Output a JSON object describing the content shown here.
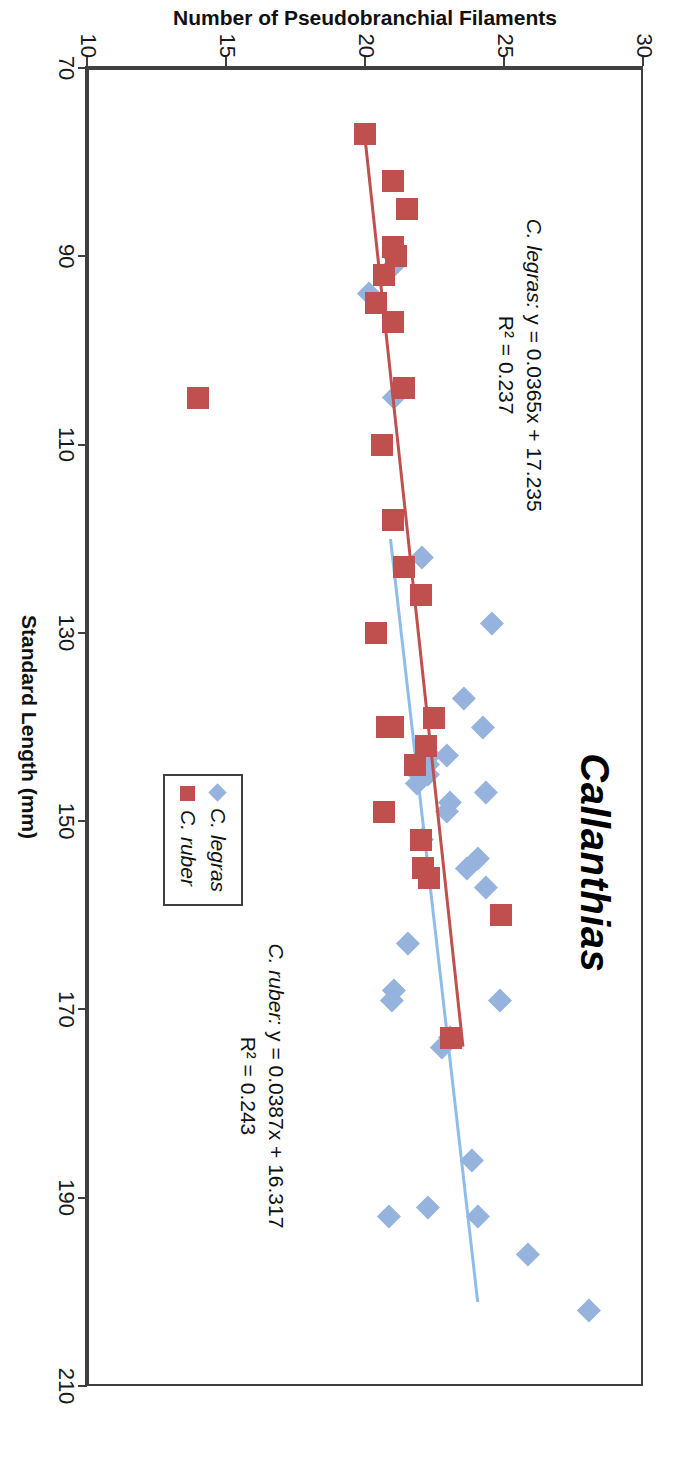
{
  "chart_data": {
    "type": "scatter",
    "title": "Callanthias",
    "xlabel": "Standard Length (mm)",
    "ylabel": "Number of Pseudobranchial Filaments",
    "xlim": [
      70,
      210
    ],
    "ylim": [
      10,
      30
    ],
    "xticks": [
      70,
      90,
      110,
      130,
      150,
      170,
      190,
      210
    ],
    "yticks": [
      10,
      15,
      20,
      25,
      30
    ],
    "grid": false,
    "legend_position": "bottom-right-inside",
    "colors": {
      "legras": "#95B3DD",
      "ruber": "#C0504D",
      "axis": "#3F3F3F"
    },
    "series": [
      {
        "name": "C. legras",
        "marker": "diamond",
        "color": "#95B3DD",
        "points": [
          [
            94,
            20.1
          ],
          [
            91,
            21.0
          ],
          [
            90,
            21.0
          ],
          [
            105,
            21.0
          ],
          [
            122,
            22.0
          ],
          [
            129,
            24.5
          ],
          [
            137,
            23.5
          ],
          [
            140,
            24.2
          ],
          [
            143,
            22.9
          ],
          [
            143,
            22.3
          ],
          [
            144,
            22.2
          ],
          [
            145,
            22.2
          ],
          [
            145,
            21.9
          ],
          [
            146,
            21.8
          ],
          [
            147,
            24.3
          ],
          [
            148,
            23.0
          ],
          [
            149,
            22.9
          ],
          [
            152,
            22.0
          ],
          [
            154,
            24.0
          ],
          [
            155,
            23.6
          ],
          [
            157,
            24.3
          ],
          [
            163,
            21.5
          ],
          [
            168,
            21.0
          ],
          [
            169,
            20.9
          ],
          [
            169,
            24.8
          ],
          [
            174,
            22.7
          ],
          [
            173,
            23.0
          ],
          [
            186,
            23.8
          ],
          [
            191,
            22.2
          ],
          [
            192,
            20.8
          ],
          [
            192,
            24.0
          ],
          [
            196,
            25.8
          ],
          [
            202,
            28.0
          ]
        ],
        "trendline": {
          "slope": 0.0387,
          "intercept": 16.317,
          "r2": 0.243,
          "equation": "y = 0.0387x + 16.317",
          "r2_label": "R² = 0.243",
          "label": "C. ruber:"
        }
      },
      {
        "name": "C. ruber",
        "marker": "square",
        "color": "#C0504D",
        "points": [
          [
            77,
            20.0
          ],
          [
            82,
            21.0
          ],
          [
            85,
            21.5
          ],
          [
            89,
            21.0
          ],
          [
            90,
            21.1
          ],
          [
            92,
            20.7
          ],
          [
            95,
            20.4
          ],
          [
            97,
            21.0
          ],
          [
            104,
            21.4
          ],
          [
            105,
            14.0
          ],
          [
            110,
            20.6
          ],
          [
            118,
            21.0
          ],
          [
            123,
            21.4
          ],
          [
            126,
            22.0
          ],
          [
            130,
            20.4
          ],
          [
            139,
            22.5
          ],
          [
            140,
            20.8
          ],
          [
            140,
            21.0
          ],
          [
            142,
            22.2
          ],
          [
            144,
            21.8
          ],
          [
            149,
            20.7
          ],
          [
            152,
            22.0
          ],
          [
            155,
            22.1
          ],
          [
            156,
            22.3
          ],
          [
            160,
            24.9
          ],
          [
            173,
            23.1
          ]
        ],
        "trendline": {
          "slope": 0.0365,
          "intercept": 17.235,
          "r2": 0.237,
          "equation": "y = 0.0365x + 17.235",
          "r2_label": "R² = 0.237",
          "label": "C. legras:"
        }
      }
    ],
    "annotations": [
      {
        "id": "ann-ruber",
        "species": "C. ruber:",
        "equation": "y = 0.0387x + 16.317",
        "r2": "R² = 0.243"
      },
      {
        "id": "ann-legras",
        "species": "C. legras:",
        "equation": "y = 0.0365x + 17.235",
        "r2": "R² = 0.237"
      }
    ],
    "legend": [
      {
        "label": "C. legras",
        "marker": "diamond",
        "color": "#95B3DD"
      },
      {
        "label": "C. ruber",
        "marker": "square",
        "color": "#C0504D"
      }
    ]
  }
}
